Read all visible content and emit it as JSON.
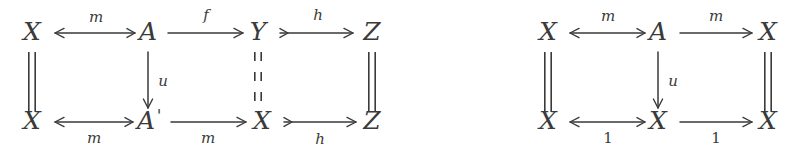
{
  "figure": {
    "type": "commutative-diagram-pair",
    "background_color": "#ffffff",
    "ink_color": "#3a3a3a",
    "width": 805,
    "height": 151
  },
  "diagrams": [
    {
      "id": "left-diagram",
      "name": "left-commutative-square",
      "nodes": [
        {
          "id": "tl",
          "label": "X",
          "prime": "",
          "x": 32,
          "y": 40,
          "row": "top",
          "col": 0
        },
        {
          "id": "tm",
          "label": "A",
          "prime": "",
          "x": 148,
          "y": 40,
          "row": "top",
          "col": 1
        },
        {
          "id": "tr",
          "label": "Y",
          "prime": "",
          "x": 258,
          "y": 40,
          "row": "top",
          "col": 2
        },
        {
          "id": "tz",
          "label": "Z",
          "prime": "",
          "x": 372,
          "y": 40,
          "row": "top",
          "col": 3
        },
        {
          "id": "bl",
          "label": "X",
          "prime": "",
          "x": 32,
          "y": 129,
          "row": "bottom",
          "col": 0
        },
        {
          "id": "bm",
          "label": "A",
          "prime": "'",
          "x": 146,
          "y": 129,
          "row": "bottom",
          "col": 1
        },
        {
          "id": "br",
          "label": "X",
          "prime": "",
          "x": 262,
          "y": 129,
          "row": "bottom",
          "col": 2
        },
        {
          "id": "bz",
          "label": "Z",
          "prime": "",
          "x": 372,
          "y": 129,
          "row": "bottom",
          "col": 3
        }
      ],
      "edges": [
        {
          "id": "l-top-m",
          "name": "arrow-top-m-left",
          "label": "m",
          "label_style": "italic",
          "label_pos": "above",
          "direction": "left",
          "head": "arrowhead",
          "tail": "barb",
          "x1": 135,
          "x2": 55,
          "y": 33,
          "label_x": 96,
          "label_y": 22
        },
        {
          "id": "l-top-f",
          "name": "arrow-top-f",
          "label": "f",
          "label_style": "italic",
          "label_pos": "above",
          "direction": "right",
          "head": "arrowhead",
          "tail": "none",
          "x1": 168,
          "x2": 243,
          "y": 33,
          "label_x": 206,
          "label_y": 20
        },
        {
          "id": "l-top-h",
          "name": "arrow-top-h",
          "label": "h",
          "label_style": "italic",
          "label_pos": "above",
          "direction": "right",
          "head": "arrowhead",
          "tail": "barb",
          "x1": 280,
          "x2": 353,
          "y": 33,
          "label_x": 318,
          "label_y": 20
        },
        {
          "id": "l-bot-m1",
          "name": "arrow-bottom-m-left",
          "label": "m",
          "label_style": "italic",
          "label_pos": "below",
          "direction": "left",
          "head": "arrowhead",
          "tail": "barb",
          "x1": 133,
          "x2": 55,
          "y": 122,
          "label_x": 94,
          "label_y": 143
        },
        {
          "id": "l-bot-m2",
          "name": "arrow-bottom-m-right",
          "label": "m",
          "label_style": "italic",
          "label_pos": "below",
          "direction": "right",
          "head": "arrowhead",
          "tail": "none",
          "x1": 171,
          "x2": 246,
          "y": 122,
          "label_x": 208,
          "label_y": 143
        },
        {
          "id": "l-bot-h",
          "name": "arrow-bottom-h",
          "label": "h",
          "label_style": "italic",
          "label_pos": "below",
          "direction": "right",
          "head": "arrowhead",
          "tail": "barb",
          "x1": 284,
          "x2": 356,
          "y": 122,
          "label_x": 320,
          "label_y": 144
        },
        {
          "id": "l-vert-u",
          "name": "arrow-vertical-u",
          "label": "u",
          "label_style": "italic",
          "label_pos": "right",
          "direction": "down",
          "head": "arrowhead",
          "tail": "none",
          "x": 148,
          "y1": 52,
          "y2": 108,
          "label_x": 163,
          "label_y": 86
        }
      ],
      "identity_bars": [
        {
          "id": "l-id-left",
          "name": "identity-bar-left",
          "x": 32,
          "y1": 52,
          "y2": 112,
          "style": "solid"
        },
        {
          "id": "l-id-mid",
          "name": "identity-bar-middle",
          "x": 258,
          "y1": 52,
          "y2": 112,
          "style": "dashed"
        },
        {
          "id": "l-id-right",
          "name": "identity-bar-right",
          "x": 372,
          "y1": 52,
          "y2": 112,
          "style": "solid"
        }
      ]
    },
    {
      "id": "right-diagram",
      "name": "right-commutative-square",
      "nodes": [
        {
          "id": "rtl",
          "label": "X",
          "prime": "",
          "x": 548,
          "y": 40,
          "row": "top",
          "col": 0
        },
        {
          "id": "rtm",
          "label": "A",
          "prime": "",
          "x": 658,
          "y": 40,
          "row": "top",
          "col": 1
        },
        {
          "id": "rtr",
          "label": "X",
          "prime": "",
          "x": 768,
          "y": 40,
          "row": "top",
          "col": 2
        },
        {
          "id": "rbl",
          "label": "X",
          "prime": "",
          "x": 548,
          "y": 129,
          "row": "bottom",
          "col": 0
        },
        {
          "id": "rbm",
          "label": "X",
          "prime": "",
          "x": 658,
          "y": 129,
          "row": "bottom",
          "col": 1
        },
        {
          "id": "rbr",
          "label": "X",
          "prime": "",
          "x": 768,
          "y": 129,
          "row": "bottom",
          "col": 2
        }
      ],
      "edges": [
        {
          "id": "r-top-m1",
          "name": "arrow-top-m-left",
          "label": "m",
          "label_style": "italic",
          "label_pos": "above",
          "direction": "left",
          "head": "arrowhead",
          "tail": "barb",
          "x1": 645,
          "x2": 570,
          "y": 33,
          "label_x": 608,
          "label_y": 21
        },
        {
          "id": "r-top-m2",
          "name": "arrow-top-m-right",
          "label": "m",
          "label_style": "italic",
          "label_pos": "above",
          "direction": "right",
          "head": "arrowhead",
          "tail": "none",
          "x1": 680,
          "x2": 752,
          "y": 33,
          "label_x": 716,
          "label_y": 21
        },
        {
          "id": "r-bot-1a",
          "name": "arrow-bottom-one-left",
          "label": "1",
          "label_style": "upright",
          "label_pos": "below",
          "direction": "left",
          "head": "arrowhead",
          "tail": "barb",
          "x1": 645,
          "x2": 570,
          "y": 122,
          "label_x": 608,
          "label_y": 143
        },
        {
          "id": "r-bot-1b",
          "name": "arrow-bottom-one-right",
          "label": "1",
          "label_style": "upright",
          "label_pos": "below",
          "direction": "right",
          "head": "arrowhead",
          "tail": "none",
          "x1": 680,
          "x2": 752,
          "y": 122,
          "label_x": 716,
          "label_y": 143
        },
        {
          "id": "r-vert-u",
          "name": "arrow-vertical-u",
          "label": "u",
          "label_style": "italic",
          "label_pos": "right",
          "direction": "down",
          "head": "arrowhead",
          "tail": "none",
          "x": 658,
          "y1": 52,
          "y2": 108,
          "label_x": 673,
          "label_y": 86
        }
      ],
      "identity_bars": [
        {
          "id": "r-id-left",
          "name": "identity-bar-left",
          "x": 548,
          "y1": 52,
          "y2": 112,
          "style": "solid"
        },
        {
          "id": "r-id-right",
          "name": "identity-bar-right",
          "x": 768,
          "y1": 52,
          "y2": 112,
          "style": "solid"
        }
      ]
    }
  ]
}
